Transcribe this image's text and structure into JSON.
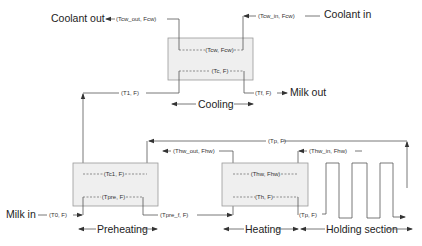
{
  "diagram": {
    "type": "process-flow",
    "colors": {
      "line": "#555555",
      "box_fill": "#efefef",
      "box_border": "#9a9a9a",
      "text": "#222222"
    },
    "external_labels": {
      "coolant_out": "Coolant out",
      "coolant_in": "Coolant in",
      "milk_out": "Milk out",
      "milk_in": "Milk in"
    },
    "units": {
      "cooling": {
        "label": "Cooling",
        "inner_top": "(Tcw, Fcw)",
        "inner_bottom": "(Tc, F)"
      },
      "preheating": {
        "label": "Preheating",
        "inner_top": "(Tc1, F)",
        "inner_bottom": "(Tpre, F)"
      },
      "heating": {
        "label": "Heating",
        "inner_top": "(Thw, Fhw)",
        "inner_bottom": "(Th, F)"
      },
      "holding": {
        "label": "Holding section"
      }
    },
    "streams": {
      "tcw_out": "(Tcw_out, Fcw)",
      "tcw_in": "(Tcw_in, Fcw)",
      "t1": "(T1, F)",
      "tf": "(Tf, F)",
      "tp_top": "(Tp, F)",
      "thw_out": "(Thw_out, Fhw)",
      "thw_in": "(Thw_in, Fhw)",
      "t0": "(T0, F)",
      "tpre_f": "(Tpre_f, F)",
      "tp_bottom": "(Tp, F)"
    }
  }
}
